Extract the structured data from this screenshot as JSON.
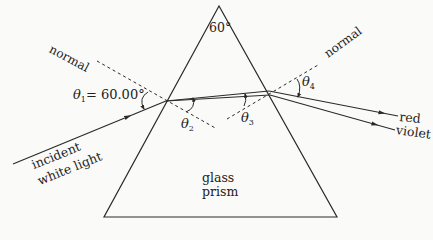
{
  "diagram": {
    "prism": {
      "label_line1": "glass",
      "label_line2": "prism",
      "apex_angle": "60°",
      "apex": [
        219,
        6
      ],
      "base_left": [
        104,
        217
      ],
      "base_right": [
        337,
        217
      ]
    },
    "labels": {
      "normal_left": "normal",
      "normal_right": "normal",
      "theta1_symbol": "θ",
      "theta1_sub": "1",
      "theta1_value": "= 60.00°",
      "theta2_symbol": "θ",
      "theta2_sub": "2",
      "theta3_symbol": "θ",
      "theta3_sub": "3",
      "theta4_symbol": "θ",
      "theta4_sub": "4",
      "incident_line1": "incident",
      "incident_line2": "white light",
      "ray_red": "red",
      "ray_violet": "violet"
    },
    "rays": {
      "incident": {
        "from": [
          13,
          164
        ],
        "to": [
          166,
          101
        ]
      },
      "internal": {
        "from": [
          166,
          101
        ],
        "to": [
          269,
          93
        ]
      },
      "red_out": {
        "from": [
          269,
          93
        ],
        "to": [
          398,
          118
        ]
      },
      "violet_out": {
        "from": [
          269,
          93
        ],
        "to": [
          395,
          132
        ]
      }
    },
    "normals": {
      "entry": {
        "from": [
          97,
          61
        ],
        "to": [
          217,
          129
        ]
      },
      "exit": {
        "from": [
          227,
          119
        ],
        "to": [
          318,
          65
        ]
      }
    },
    "colors": {
      "line": "#2a2a2a",
      "background": "#fafaf8"
    }
  }
}
